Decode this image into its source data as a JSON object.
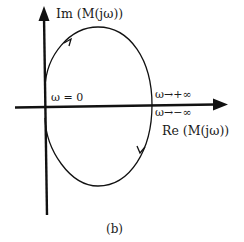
{
  "diagram": {
    "type": "nyquist-plot",
    "y_axis_label": "Im (M(jω))",
    "x_axis_label": "Re (M(jω))",
    "origin_label": "ω = 0",
    "plus_inf_label": "ω→+∞",
    "minus_inf_label": "ω→−∞",
    "caption": "(b)",
    "colors": {
      "stroke": "#111111",
      "background": "#ffffff"
    }
  }
}
